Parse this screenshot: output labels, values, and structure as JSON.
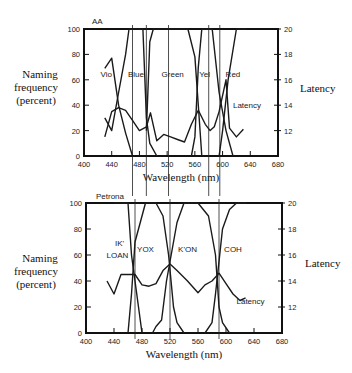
{
  "header": {
    "caption_cutoff": "…pp… … … …pp…"
  },
  "chart_data": [
    {
      "type": "line",
      "title": "AA",
      "xlabel": "Wavelength  (nm)",
      "ylabel": [
        "Naming",
        "frequency",
        "(percent)"
      ],
      "ylabel_right": "Latency",
      "xlim": [
        400,
        680
      ],
      "ylim": [
        0,
        100
      ],
      "ylim_right": [
        10,
        20
      ],
      "x_ticks": [
        400,
        440,
        480,
        520,
        560,
        600,
        640,
        680
      ],
      "y_ticks": [
        0,
        20,
        40,
        60,
        80,
        100
      ],
      "y_ticks_right": [
        12,
        14,
        16,
        18,
        20
      ],
      "grid": false,
      "region_labels": [
        {
          "label": "Vio",
          "x": 432,
          "y": 62
        },
        {
          "label": "Blue",
          "x": 475,
          "y": 62
        },
        {
          "label": "Green",
          "x": 528,
          "y": 62
        },
        {
          "label": "Yel",
          "x": 574,
          "y": 62
        },
        {
          "label": "Red",
          "x": 615,
          "y": 62
        }
      ],
      "latency_label": {
        "label": "Latency",
        "x": 615,
        "y": 14
      },
      "guides": [
        470,
        490,
        522,
        580,
        596
      ],
      "series": [
        {
          "name": "Vio",
          "axis": "left",
          "points": [
            [
              430,
              69
            ],
            [
              440,
              77
            ],
            [
              450,
              40
            ],
            [
              460,
              18
            ],
            [
              470,
              0
            ]
          ]
        },
        {
          "name": "Blue",
          "axis": "left",
          "points": [
            [
              430,
              30
            ],
            [
              440,
              20
            ],
            [
              450,
              50
            ],
            [
              460,
              80
            ],
            [
              465,
              100
            ],
            [
              485,
              100
            ],
            [
              490,
              30
            ],
            [
              495,
              10
            ],
            [
              505,
              0
            ]
          ]
        },
        {
          "name": "Green",
          "axis": "left",
          "points": [
            [
              490,
              20
            ],
            [
              495,
              90
            ],
            [
              500,
              100
            ],
            [
              550,
              100
            ],
            [
              560,
              78
            ],
            [
              565,
              40
            ],
            [
              570,
              0
            ]
          ]
        },
        {
          "name": "Yel",
          "axis": "left",
          "points": [
            [
              555,
              0
            ],
            [
              560,
              15
            ],
            [
              565,
              70
            ],
            [
              570,
              100
            ],
            [
              585,
              100
            ],
            [
              595,
              50
            ],
            [
              605,
              20
            ],
            [
              615,
              0
            ]
          ]
        },
        {
          "name": "Red",
          "axis": "left",
          "points": [
            [
              595,
              0
            ],
            [
              600,
              20
            ],
            [
              608,
              60
            ],
            [
              620,
              100
            ],
            [
              635,
              100
            ]
          ]
        },
        {
          "name": "Latency",
          "axis": "right",
          "points": [
            [
              430,
              11.5
            ],
            [
              440,
              13.5
            ],
            [
              450,
              13.8
            ],
            [
              460,
              13.6
            ],
            [
              470,
              12.8
            ],
            [
              480,
              12
            ],
            [
              490,
              12.3
            ],
            [
              496,
              13.4
            ],
            [
              505,
              11.2
            ],
            [
              515,
              11.7
            ],
            [
              525,
              11.5
            ],
            [
              535,
              11.3
            ],
            [
              545,
              11.1
            ],
            [
              555,
              12.5
            ],
            [
              565,
              13.6
            ],
            [
              575,
              12.5
            ],
            [
              582,
              12.0
            ],
            [
              588,
              12.3
            ],
            [
              595,
              13.5
            ],
            [
              605,
              16.0
            ],
            [
              610,
              12.2
            ],
            [
              620,
              11.5
            ],
            [
              630,
              12.1
            ]
          ]
        }
      ]
    },
    {
      "type": "line",
      "title": "Petrona",
      "xlabel": "Wavelength  (nm)",
      "ylabel": [
        "Naming",
        "frequency",
        "(percent)"
      ],
      "ylabel_right": "Latency",
      "xlim": [
        400,
        680
      ],
      "ylim": [
        0,
        100
      ],
      "ylim_right": [
        10,
        20
      ],
      "x_ticks": [
        400,
        440,
        480,
        520,
        560,
        600,
        640,
        680
      ],
      "y_ticks": [
        0,
        20,
        40,
        60,
        80,
        100
      ],
      "y_ticks_right": [
        12,
        14,
        16,
        18,
        20
      ],
      "grid": false,
      "region_labels": [
        {
          "label": "IK'",
          "x": 448,
          "y": 67
        },
        {
          "label": "LOAN",
          "x": 445,
          "y": 58
        },
        {
          "label": "YOX",
          "x": 485,
          "y": 62
        },
        {
          "label": "K'ON",
          "x": 545,
          "y": 62
        },
        {
          "label": "COH",
          "x": 610,
          "y": 62
        }
      ],
      "latency_label": {
        "label": "Latency",
        "x": 615,
        "y": 12.5
      },
      "guides": [
        470,
        520,
        590
      ],
      "series": [
        {
          "name": "IK' LOAN",
          "axis": "left",
          "points": [
            [
              440,
              100
            ],
            [
              460,
              100
            ],
            [
              465,
              60
            ],
            [
              470,
              40
            ],
            [
              480,
              0
            ]
          ]
        },
        {
          "name": "YOX",
          "axis": "left",
          "points": [
            [
              460,
              0
            ],
            [
              465,
              30
            ],
            [
              470,
              70
            ],
            [
              480,
              90
            ],
            [
              485,
              100
            ],
            [
              500,
              100
            ],
            [
              510,
              90
            ],
            [
              518,
              60
            ],
            [
              525,
              20
            ],
            [
              530,
              8
            ],
            [
              540,
              0
            ]
          ]
        },
        {
          "name": "K'ON",
          "axis": "left",
          "points": [
            [
              495,
              0
            ],
            [
              500,
              5
            ],
            [
              508,
              10
            ],
            [
              515,
              40
            ],
            [
              520,
              55
            ],
            [
              530,
              85
            ],
            [
              540,
              100
            ],
            [
              560,
              100
            ],
            [
              575,
              90
            ],
            [
              585,
              60
            ],
            [
              590,
              20
            ],
            [
              595,
              8
            ],
            [
              605,
              0
            ]
          ]
        },
        {
          "name": "COH",
          "axis": "left",
          "points": [
            [
              570,
              0
            ],
            [
              580,
              8
            ],
            [
              585,
              30
            ],
            [
              590,
              55
            ],
            [
              595,
              80
            ],
            [
              605,
              95
            ],
            [
              615,
              100
            ],
            [
              630,
              100
            ]
          ]
        },
        {
          "name": "Latency",
          "axis": "right",
          "points": [
            [
              430,
              14
            ],
            [
              440,
              13
            ],
            [
              450,
              14.5
            ],
            [
              460,
              14.5
            ],
            [
              470,
              14.5
            ],
            [
              480,
              13.7
            ],
            [
              490,
              13.6
            ],
            [
              500,
              13.8
            ],
            [
              510,
              14.8
            ],
            [
              520,
              15.3
            ],
            [
              530,
              14.8
            ],
            [
              545,
              14.0
            ],
            [
              560,
              13.1
            ],
            [
              570,
              13.7
            ],
            [
              580,
              14.0
            ],
            [
              590,
              14.6
            ],
            [
              600,
              13.8
            ],
            [
              610,
              13.0
            ],
            [
              620,
              12.5
            ],
            [
              628,
              12.7
            ]
          ]
        }
      ]
    }
  ]
}
